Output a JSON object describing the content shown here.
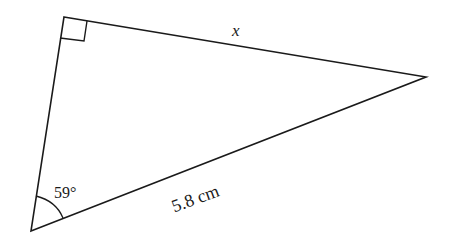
{
  "diagram": {
    "type": "right-triangle",
    "vertices": {
      "right_angle": [
        64,
        17
      ],
      "far_right": [
        426,
        77
      ],
      "bottom_left": [
        31,
        231
      ]
    },
    "labels": {
      "side_x": "x",
      "hypotenuse": "5.8 cm",
      "angle": "59°"
    },
    "stroke_color": "#1a1a1a",
    "background": "#ffffff"
  }
}
